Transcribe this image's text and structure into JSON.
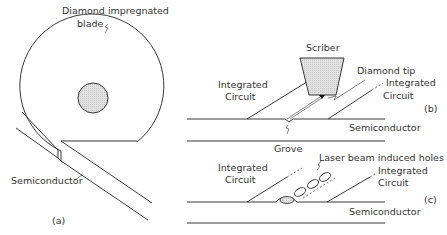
{
  "panels": {
    "a": {
      "tag": "(a)",
      "labels": {
        "blade_line1": "Diamond impregnated",
        "blade_line2": "blade",
        "semiconductor": "Semiconductor"
      }
    },
    "b": {
      "tag": "(b)",
      "labels": {
        "scriber": "Scriber",
        "diamond_tip": "Diamond tip",
        "ic_left_line1": "Integrated",
        "ic_left_line2": "Circuit",
        "ic_right_line1": "Integrated",
        "ic_right_line2": "Circuit",
        "semiconductor": "Semiconductor",
        "grove": "Grove"
      }
    },
    "c": {
      "tag": "(c)",
      "labels": {
        "ic_left_line1": "Integrated",
        "ic_left_line2": "Circuit",
        "holes": "Laser beam induced holes",
        "ic_right_line1": "Integrated",
        "ic_right_line2": "Circuit",
        "semiconductor": "Semiconductor"
      }
    }
  },
  "colors": {
    "line": "#222222",
    "fill_gray": "#dcdcdc",
    "text": "#333333"
  }
}
